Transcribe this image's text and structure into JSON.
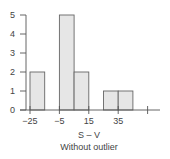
{
  "chart_data": {
    "type": "bar",
    "title": "",
    "xlabel": "S – V",
    "subtitle": "Without outlier",
    "ylabel": "",
    "bins": [
      {
        "start": -25,
        "end": -15,
        "count": 2
      },
      {
        "start": -15,
        "end": -5,
        "count": 0
      },
      {
        "start": -5,
        "end": 5,
        "count": 5
      },
      {
        "start": 5,
        "end": 15,
        "count": 2
      },
      {
        "start": 15,
        "end": 25,
        "count": 0
      },
      {
        "start": 25,
        "end": 35,
        "count": 1
      },
      {
        "start": 35,
        "end": 45,
        "count": 1
      }
    ],
    "categories": [
      "-25 to -15",
      "-15 to -5",
      "-5 to 5",
      "5 to 15",
      "15 to 25",
      "25 to 35",
      "35 to 45"
    ],
    "values": [
      2,
      0,
      5,
      2,
      0,
      1,
      1
    ],
    "x_ticks": [
      {
        "value": -25,
        "label": "−25"
      },
      {
        "value": -5,
        "label": "−5"
      },
      {
        "value": 15,
        "label": "15"
      },
      {
        "value": 35,
        "label": "35"
      },
      {
        "value": 55,
        "label": ""
      }
    ],
    "y_ticks": [
      0,
      1,
      2,
      3,
      4,
      5
    ],
    "ylim": [
      0,
      5
    ],
    "xlim": [
      -30,
      60
    ],
    "grid": false,
    "legend": "none",
    "bar_fill": "#e6e6e6",
    "bar_stroke": "#666666",
    "axis_color": "#555555"
  }
}
